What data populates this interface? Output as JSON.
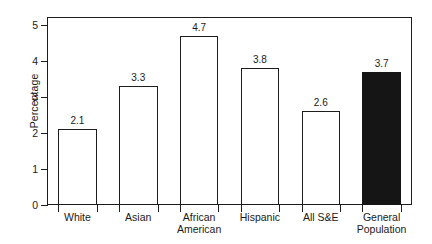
{
  "chart_data": {
    "type": "bar",
    "title": "",
    "subtitle": "",
    "xlabel": "",
    "ylabel": "Percentage",
    "categories": [
      "White",
      "Asian",
      "African American",
      "Hispanic",
      "All S&E",
      "General Population"
    ],
    "values": [
      2.1,
      3.3,
      4.7,
      3.8,
      2.6,
      3.7
    ],
    "value_labels": [
      "2.1",
      "3.3",
      "4.7",
      "3.8",
      "2.6",
      "3.7"
    ],
    "category_lines": [
      [
        "White"
      ],
      [
        "Asian"
      ],
      [
        "African",
        "American"
      ],
      [
        "Hispanic"
      ],
      [
        "All S&E"
      ],
      [
        "General",
        "Population"
      ]
    ],
    "ylim": [
      0,
      5.22
    ],
    "yticks": [
      0,
      1,
      2,
      3,
      4,
      5
    ],
    "ytick_labels": [
      "0",
      "1",
      "2",
      "3",
      "4",
      "5"
    ],
    "grid": false,
    "legend": "none",
    "bar_styles": [
      "open",
      "open",
      "open",
      "open",
      "open",
      "filled"
    ],
    "colors": {
      "axis": "#1d1d1d",
      "bar_outline": "#1d1d1d",
      "bar_fill_open": "#ffffff",
      "bar_fill_filled": "#151515",
      "text": "#1a1a1a",
      "background": "#ffffff"
    }
  }
}
